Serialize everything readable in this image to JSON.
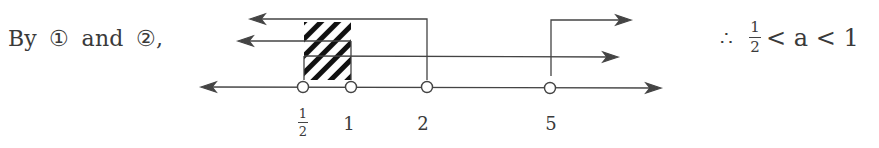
{
  "lead_text": {
    "prefix": "By",
    "ref1": "①",
    "conj": "and",
    "ref2": "②,"
  },
  "number_line": {
    "points": [
      {
        "label_num": "1",
        "label_den": "2",
        "value": 0.5,
        "x": 303,
        "open": true
      },
      {
        "label": "1",
        "value": 1,
        "x": 351,
        "open": true
      },
      {
        "label": "2",
        "value": 2,
        "x": 427,
        "open": true
      },
      {
        "label": "5",
        "value": 5,
        "x": 550,
        "open": true
      }
    ],
    "rays": [
      {
        "id": "ray-x-lt-2",
        "from_x": 427,
        "y": 19,
        "direction": "left"
      },
      {
        "id": "ray-x-lt-1",
        "from_x": 351,
        "y": 41,
        "direction": "left"
      },
      {
        "id": "ray-x-gt-half",
        "from_x": 303,
        "y": 56,
        "direction": "right"
      },
      {
        "id": "ray-x-gt-5",
        "from_x": 551,
        "y": 20,
        "direction": "right"
      }
    ],
    "shaded_interval": {
      "from": "1/2",
      "to": "1",
      "pattern": "hatched"
    }
  },
  "conclusion": {
    "therefore": "∴",
    "frac_num": "1",
    "frac_den": "2",
    "inequality": "< a < 1"
  },
  "colors": {
    "ink": "#3a3a3a",
    "background": "#ffffff"
  }
}
